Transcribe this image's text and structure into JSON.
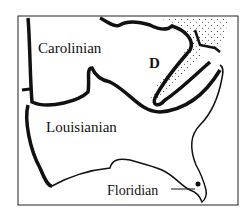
{
  "map": {
    "regions": [
      {
        "id": "carolinian",
        "label": "Carolinian"
      },
      {
        "id": "louisianian",
        "label": "Louisianian"
      },
      {
        "id": "floridian",
        "label": "Floridian"
      },
      {
        "id": "d",
        "label": "D"
      }
    ],
    "colors": {
      "border": "#111111",
      "background": "#ffffff",
      "stipple": "#333333"
    }
  }
}
